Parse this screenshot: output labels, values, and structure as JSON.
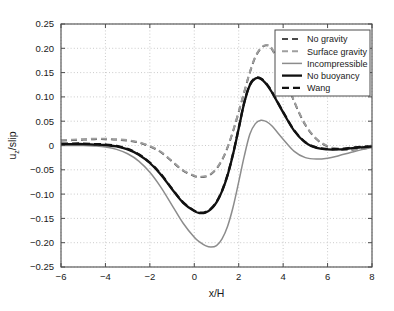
{
  "chart_data": {
    "type": "line",
    "title": "",
    "xlabel": "x/H",
    "ylabel": "u_z/slip",
    "ylabel_parts": {
      "main": "u",
      "sub": "z",
      "tail": "/slip"
    },
    "xlim": [
      -6,
      8
    ],
    "ylim": [
      -0.25,
      0.25
    ],
    "xticks": [
      -6,
      -4,
      -2,
      0,
      2,
      4,
      6,
      8
    ],
    "xticklabels": [
      "−6",
      "−4",
      "−2",
      "0",
      "2",
      "4",
      "6",
      "8"
    ],
    "yticks": [
      -0.25,
      -0.2,
      -0.15,
      -0.1,
      -0.05,
      0,
      0.05,
      0.1,
      0.15,
      0.2,
      0.25
    ],
    "yticklabels": [
      "−0.25",
      "−0.20",
      "−0.15",
      "−0.10",
      "−0.05",
      "0",
      "0.05",
      "0.10",
      "0.15",
      "0.20",
      "0.25"
    ],
    "grid": true,
    "grid_style": "dotted",
    "grid_color": "#bdbdbd",
    "axes_color": "#4d4d4d",
    "legend_position": "upper right",
    "legend_border_color": "#4d4d4d",
    "series": [
      {
        "name": "No gravity",
        "color": "#4a4a4a",
        "dash": "6,4",
        "width": 1.9,
        "x": [
          -6,
          -5.5,
          -5,
          -4.5,
          -4,
          -3.5,
          -3,
          -2.5,
          -2,
          -1.5,
          -1,
          -0.5,
          0,
          0.25,
          0.5,
          0.75,
          1,
          1.25,
          1.5,
          1.75,
          2,
          2.25,
          2.5,
          2.75,
          3,
          3.25,
          3.5,
          4,
          4.5,
          5,
          5.5,
          6,
          6.5,
          7,
          7.5,
          8
        ],
        "y": [
          0.01,
          0.011,
          0.012,
          0.013,
          0.013,
          0.012,
          0.01,
          0.006,
          -0.002,
          -0.014,
          -0.033,
          -0.052,
          -0.063,
          -0.065,
          -0.064,
          -0.059,
          -0.048,
          -0.03,
          -0.004,
          0.03,
          0.069,
          0.11,
          0.15,
          0.182,
          0.2,
          0.206,
          0.198,
          0.15,
          0.09,
          0.042,
          0.013,
          -0.002,
          -0.008,
          -0.009,
          -0.007,
          -0.004
        ]
      },
      {
        "name": "Surface gravity",
        "color": "#9f9f9f",
        "dash": "6,4",
        "width": 1.9,
        "x": [
          -6,
          -5.5,
          -5,
          -4.5,
          -4,
          -3.5,
          -3,
          -2.5,
          -2,
          -1.5,
          -1,
          -0.5,
          0,
          0.25,
          0.5,
          0.75,
          1,
          1.25,
          1.5,
          1.75,
          2,
          2.25,
          2.5,
          2.75,
          3,
          3.25,
          3.5,
          4,
          4.5,
          5,
          5.5,
          6,
          6.5,
          7,
          7.5,
          8
        ],
        "y": [
          0.011,
          0.012,
          0.013,
          0.014,
          0.014,
          0.013,
          0.011,
          0.007,
          -0.001,
          -0.013,
          -0.032,
          -0.051,
          -0.062,
          -0.064,
          -0.063,
          -0.058,
          -0.047,
          -0.029,
          -0.003,
          0.031,
          0.07,
          0.111,
          0.151,
          0.183,
          0.201,
          0.207,
          0.199,
          0.151,
          0.091,
          0.043,
          0.014,
          -0.001,
          -0.007,
          -0.008,
          -0.006,
          -0.003
        ]
      },
      {
        "name": "Incompressible",
        "color": "#8c8c8c",
        "dash": "none",
        "width": 1.5,
        "x": [
          -6,
          -5.5,
          -5,
          -4.5,
          -4,
          -3.5,
          -3,
          -2.5,
          -2,
          -1.5,
          -1,
          -0.5,
          0,
          0.25,
          0.5,
          0.75,
          1,
          1.25,
          1.5,
          1.75,
          2,
          2.25,
          2.5,
          2.75,
          3,
          3.25,
          3.5,
          4,
          4.5,
          5,
          5.5,
          6,
          6.5,
          7,
          7.5,
          8
        ],
        "y": [
          0.0,
          0.0,
          0.0,
          -0.001,
          -0.003,
          -0.008,
          -0.017,
          -0.032,
          -0.055,
          -0.086,
          -0.123,
          -0.16,
          -0.189,
          -0.199,
          -0.206,
          -0.209,
          -0.206,
          -0.192,
          -0.166,
          -0.126,
          -0.075,
          -0.022,
          0.023,
          0.045,
          0.052,
          0.049,
          0.04,
          0.013,
          -0.012,
          -0.025,
          -0.028,
          -0.026,
          -0.021,
          -0.015,
          -0.009,
          -0.004
        ]
      },
      {
        "name": "No buoyancy",
        "color": "#111111",
        "dash": "none",
        "width": 2.3,
        "x": [
          -6,
          -5.5,
          -5,
          -4.5,
          -4,
          -3.5,
          -3,
          -2.5,
          -2,
          -1.5,
          -1,
          -0.5,
          0,
          0.25,
          0.5,
          0.75,
          1,
          1.25,
          1.5,
          1.75,
          2,
          2.25,
          2.5,
          2.75,
          3,
          3.25,
          3.5,
          4,
          4.5,
          5,
          5.5,
          6,
          6.5,
          7,
          7.5,
          8
        ],
        "y": [
          0.003,
          0.003,
          0.003,
          0.002,
          0.001,
          -0.002,
          -0.008,
          -0.019,
          -0.036,
          -0.06,
          -0.09,
          -0.118,
          -0.135,
          -0.139,
          -0.138,
          -0.131,
          -0.117,
          -0.094,
          -0.061,
          -0.017,
          0.035,
          0.088,
          0.124,
          0.138,
          0.137,
          0.126,
          0.109,
          0.068,
          0.03,
          0.006,
          -0.005,
          -0.008,
          -0.008,
          -0.006,
          -0.004,
          -0.002
        ]
      },
      {
        "name": "Wang",
        "color": "#111111",
        "dash": "7,4",
        "width": 2.3,
        "x": [
          -6,
          -5.5,
          -5,
          -4.5,
          -4,
          -3.5,
          -3,
          -2.5,
          -2,
          -1.5,
          -1,
          -0.5,
          0,
          0.25,
          0.5,
          0.75,
          1,
          1.25,
          1.5,
          1.75,
          2,
          2.25,
          2.5,
          2.75,
          3,
          3.25,
          3.5,
          4,
          4.5,
          5,
          5.5,
          6,
          6.5,
          7,
          7.5,
          8
        ],
        "y": [
          0.004,
          0.004,
          0.004,
          0.003,
          0.002,
          -0.001,
          -0.007,
          -0.018,
          -0.035,
          -0.059,
          -0.089,
          -0.117,
          -0.134,
          -0.138,
          -0.137,
          -0.13,
          -0.116,
          -0.093,
          -0.06,
          -0.016,
          0.036,
          0.089,
          0.125,
          0.139,
          0.138,
          0.127,
          0.11,
          0.069,
          0.031,
          0.007,
          -0.004,
          -0.007,
          -0.007,
          -0.005,
          -0.003,
          -0.001
        ]
      }
    ]
  }
}
